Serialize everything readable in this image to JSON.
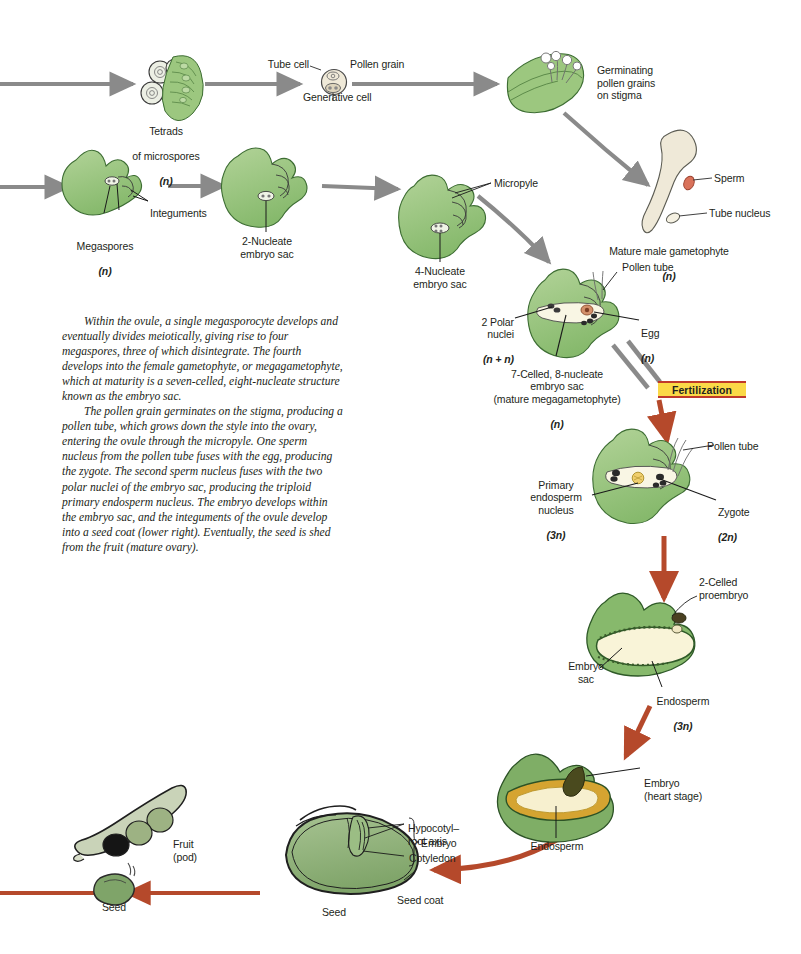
{
  "figure": {
    "domain": "biology-life-cycle-diagram",
    "background_color": "#ffffff",
    "palette": {
      "tissue_green_light": "#a9cd8f",
      "tissue_green": "#8dbf72",
      "tissue_green_dark": "#6f9f58",
      "outline": "#231f20",
      "gray_arrow": "#8a8a8a",
      "red_arrow": "#b5492b",
      "badge_fill": "#fbd947",
      "badge_border": "#c0392b",
      "endosperm_cream": "#f7f2d4",
      "endosperm_yellow": "#d9a82c",
      "pollen_cream": "#efe9d8",
      "sperm_pink": "#d9725a"
    }
  },
  "labels": {
    "tube_cell": "Tube cell",
    "pollen_grain": "Pollen grain",
    "generative_cell": "Generative cell",
    "tetrads": "Tetrads\nof microspores\n(n)",
    "tetrads_line1": "Tetrads",
    "tetrads_line2": "of microspores",
    "tetrads_ploidy": "(n)",
    "germinating": "Germinating\npollen grains\non stigma",
    "sperm": "Sperm",
    "tube_nucleus": "Tube nucleus",
    "mature_male_gametophyte": "Mature male gametophyte",
    "mature_male_ploidy": "(n)",
    "integuments": "Integuments",
    "megaspores": "Megaspores",
    "megaspores_ploidy": "(n)",
    "two_nucleate": "2-Nucleate\nembryo sac",
    "four_nucleate": "4-Nucleate\nembryo sac",
    "micropyle": "Micropyle",
    "pollen_tube_1": "Pollen tube",
    "two_polar_nuclei": "2 Polar\nnuclei",
    "two_polar_ploidy": "(n + n)",
    "egg": "Egg",
    "egg_ploidy": "(n)",
    "seven_celled": "7-Celled, 8-nucleate\nembryo sac\n(mature megagametophyte)",
    "seven_celled_ploidy": "(n)",
    "fertilization": "Fertilization",
    "pollen_tube_2": "Pollen tube",
    "primary_endosperm_nucleus": "Primary\nendosperm\nnucleus",
    "primary_endosperm_ploidy": "(3n)",
    "zygote": "Zygote",
    "zygote_ploidy": "(2n)",
    "two_celled_proembryo": "2-Celled\nproembryo",
    "embryo_sac": "Embryo\nsac",
    "endosperm_3n": "Endosperm",
    "endosperm_3n_ploidy": "(3n)",
    "embryo_heart_stage": "Embryo\n(heart stage)",
    "endosperm": "Endosperm",
    "hypocotyl_root_axis": "Hypocotyl–\nroot axis",
    "cotyledon": "Cotyledon",
    "embryo_bracket": "Embryo",
    "seed_coat": "Seed coat",
    "seed_center": "Seed",
    "fruit_pod": "Fruit\n(pod)",
    "seed_left": "Seed"
  },
  "caption": {
    "paragraph_1": "Within the ovule, a single megasporocyte develops and eventually divides meiotically, giving rise to four megaspores, three of which disintegrate. The fourth develops into the female gametophyte, or megagametophyte, which at maturity is a seven-celled, eight-nucleate structure known as the embryo sac.",
    "paragraph_2": "The pollen grain germinates on the stigma, producing a pollen tube, which grows down the style into the ovary, entering the ovule through the micropyle. One sperm nucleus from the pollen tube fuses with the egg, producing the zygote. The second sperm nucleus fuses with the two polar nuclei of the embryo sac, producing the triploid primary endosperm nucleus. The embryo develops within the embryo sac, and the integuments of the ovule develop into a seed coat (lower right). Eventually, the seed is shed from the fruit (mature ovary)."
  },
  "stages": [
    {
      "id": "tetrads",
      "label": "Tetrads of microspores",
      "ploidy": "n",
      "phase": "male"
    },
    {
      "id": "pollen-grain",
      "label": "Pollen grain",
      "ploidy": "n",
      "phase": "male"
    },
    {
      "id": "germinating-pollen",
      "label": "Germinating pollen grains on stigma",
      "ploidy": "n",
      "phase": "male"
    },
    {
      "id": "mature-male-gametophyte",
      "label": "Mature male gametophyte",
      "ploidy": "n",
      "phase": "male"
    },
    {
      "id": "megaspores",
      "label": "Megaspores",
      "ploidy": "n",
      "phase": "female"
    },
    {
      "id": "two-nucleate-embryo-sac",
      "label": "2-Nucleate embryo sac",
      "ploidy": "",
      "phase": "female"
    },
    {
      "id": "four-nucleate-embryo-sac",
      "label": "4-Nucleate embryo sac",
      "ploidy": "",
      "phase": "female"
    },
    {
      "id": "seven-celled-embryo-sac",
      "label": "7-Celled, 8-nucleate embryo sac (mature megagametophyte)",
      "ploidy": "n",
      "phase": "female"
    },
    {
      "id": "fertilized-ovule",
      "label": "Primary endosperm nucleus / Zygote",
      "ploidy": "3n / 2n",
      "phase": "sporophyte"
    },
    {
      "id": "proembryo",
      "label": "2-Celled proembryo",
      "ploidy": "",
      "phase": "sporophyte"
    },
    {
      "id": "heart-stage-embryo",
      "label": "Embryo (heart stage)",
      "ploidy": "",
      "phase": "sporophyte"
    },
    {
      "id": "seed",
      "label": "Seed",
      "ploidy": "",
      "phase": "sporophyte"
    },
    {
      "id": "fruit",
      "label": "Fruit (pod)",
      "ploidy": "",
      "phase": "sporophyte"
    }
  ]
}
